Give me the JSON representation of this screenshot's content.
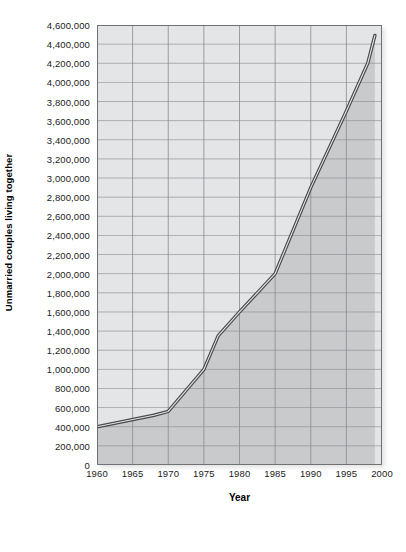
{
  "figure": {
    "caption": ""
  },
  "chart_data": {
    "type": "area",
    "title": "",
    "xlabel": "Year",
    "ylabel": "Unmarried couples living together",
    "xlim": [
      1960,
      2000
    ],
    "ylim": [
      0,
      4600000
    ],
    "grid": true,
    "legend": null,
    "x_ticks": [
      1960,
      1965,
      1970,
      1975,
      1980,
      1985,
      1990,
      1995,
      2000
    ],
    "x_tick_labels": [
      "1960",
      "1965",
      "1970",
      "1975",
      "1980",
      "1985",
      "1990",
      "1995",
      "2000"
    ],
    "y_ticks": [
      0,
      200000,
      400000,
      600000,
      800000,
      1000000,
      1200000,
      1400000,
      1600000,
      1800000,
      2000000,
      2200000,
      2400000,
      2600000,
      2800000,
      3000000,
      3200000,
      3400000,
      3600000,
      3800000,
      4000000,
      4200000,
      4400000,
      4600000
    ],
    "y_tick_labels": [
      "0",
      "200,000",
      "400,000",
      "600,000",
      "800,000",
      "1,000,000",
      "1,200,000",
      "1,400,000",
      "1,600,000",
      "1,800,000",
      "2,000,000",
      "2,200,000",
      "2,400,000",
      "2,600,000",
      "2,800,000",
      "3,000,000",
      "3,200,000",
      "3,400,000",
      "3,600,000",
      "3,800,000",
      "4,000,000",
      "4,200,000",
      "4,400,000",
      "4,600,000"
    ],
    "x": [
      1960,
      1968,
      1970,
      1975,
      1977,
      1980,
      1985,
      1990,
      1995,
      1998,
      1999
    ],
    "values": [
      400000,
      520000,
      560000,
      1000000,
      1350000,
      1600000,
      2000000,
      2900000,
      3700000,
      4200000,
      4490000
    ],
    "series": [
      {
        "name": "Unmarried couples living together",
        "points": [
          {
            "x": 1960,
            "y": 400000
          },
          {
            "x": 1968,
            "y": 520000
          },
          {
            "x": 1970,
            "y": 560000
          },
          {
            "x": 1975,
            "y": 1000000
          },
          {
            "x": 1977,
            "y": 1350000
          },
          {
            "x": 1980,
            "y": 1600000
          },
          {
            "x": 1985,
            "y": 2000000
          },
          {
            "x": 1990,
            "y": 2900000
          },
          {
            "x": 1995,
            "y": 3700000
          },
          {
            "x": 1998,
            "y": 4200000
          },
          {
            "x": 1999,
            "y": 4490000
          }
        ]
      }
    ],
    "colors": {
      "plot_background": "#e4e5e7",
      "area_fill": "#c9cacc",
      "line": "#4a4a4a",
      "gridline": "#8a8c8f",
      "axis": "#6f7175",
      "text": "#1b1b1b"
    }
  }
}
